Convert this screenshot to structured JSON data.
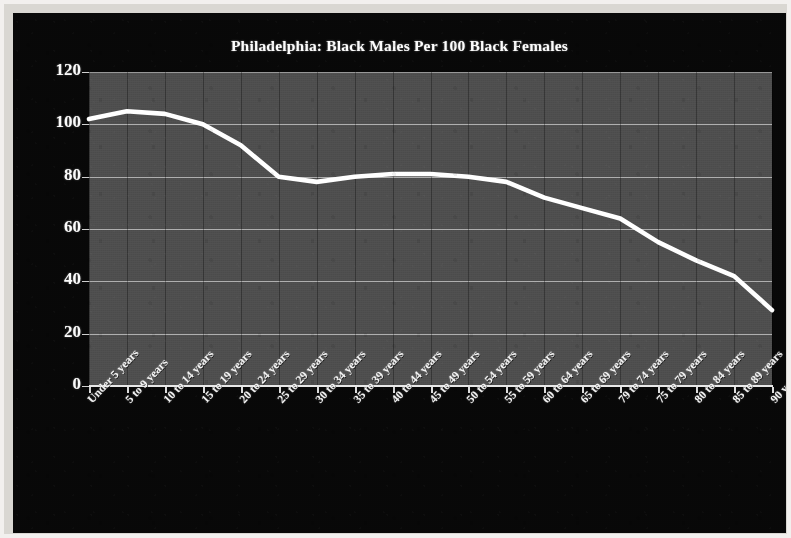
{
  "chart_data": {
    "type": "line",
    "title": "Philadelphia: Black Males Per 100 Black Females",
    "xlabel": "",
    "ylabel": "",
    "ylim": [
      0,
      120
    ],
    "ytick_labels": [
      "120",
      "100",
      "80",
      "60",
      "40",
      "20",
      "0"
    ],
    "ytick_values": [
      120,
      100,
      80,
      60,
      40,
      20,
      0
    ],
    "grid": true,
    "legend": "none",
    "series_color": "#ffffff",
    "plot_background": "#4d4d4d",
    "figure_background": "#080808",
    "categories": [
      "Under 5 years",
      "5 to 9 years",
      "10 to 14 years",
      "15 to 19 years",
      "20 to 24 years",
      "25 to 29 years",
      "30 to 34 years",
      "35 to 39 years",
      "40 to 44 years",
      "45 to 49 years",
      "50 to 54 years",
      "55 to 59 years",
      "60 to 64 years",
      "65 to 69 years",
      "79 to 74 years",
      "75 to 79 years",
      "80 to 84 years",
      "85 to 89 years",
      "90 years and over"
    ],
    "values": [
      102,
      105,
      104,
      100,
      92,
      80,
      78,
      80,
      81,
      81,
      80,
      78,
      72,
      68,
      64,
      55,
      48,
      42,
      29
    ],
    "series": [
      {
        "name": "Black males per 100 black females",
        "values": [
          102,
          105,
          104,
          100,
          92,
          80,
          78,
          80,
          81,
          81,
          80,
          78,
          72,
          68,
          64,
          55,
          48,
          42,
          29
        ]
      }
    ]
  }
}
